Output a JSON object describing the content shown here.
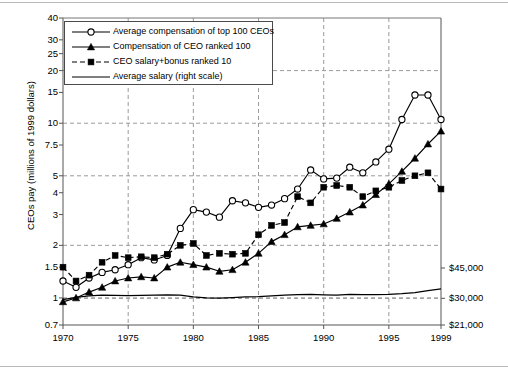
{
  "chart_data": {
    "type": "line",
    "title": "",
    "xlabel": "",
    "ylabel": "CEOs pay (millions of 1999 dollars)",
    "y_scale": "log",
    "ylim": [
      0.7,
      40
    ],
    "xlim": [
      1970,
      1999
    ],
    "grid": true,
    "legend_position": "top-left",
    "y_ticks": [
      "40",
      "30",
      "25",
      "20",
      "15",
      "10",
      "7.5",
      "5",
      "4",
      "3",
      "2",
      "1.5",
      "1",
      "0.7"
    ],
    "y_tick_values": [
      40,
      30,
      25,
      20,
      15,
      10,
      7.5,
      5,
      4,
      3,
      2,
      1.5,
      1,
      0.7
    ],
    "gridline_values": [
      40,
      20,
      10,
      5,
      2,
      1
    ],
    "x_ticks": [
      "1970",
      "1975",
      "1980",
      "1985",
      "1990",
      "1995",
      "1999"
    ],
    "x_tick_values": [
      1970,
      1975,
      1980,
      1985,
      1990,
      1995,
      1999
    ],
    "x_minor_ticks": [
      1970,
      1975,
      1980,
      1985,
      1990,
      1995,
      1999
    ],
    "right_axis": {
      "label": "",
      "ticks": [
        "$45,000",
        "$30,000",
        "$21,000"
      ],
      "tick_values": [
        45000,
        30000,
        21000
      ]
    },
    "x": [
      1970,
      1971,
      1972,
      1973,
      1974,
      1975,
      1976,
      1977,
      1978,
      1979,
      1980,
      1981,
      1982,
      1983,
      1984,
      1985,
      1986,
      1987,
      1988,
      1989,
      1990,
      1991,
      1992,
      1993,
      1994,
      1995,
      1996,
      1997,
      1998,
      1999
    ],
    "series": [
      {
        "name": "Average compensation of top 100 CEOs",
        "marker": "open-circle",
        "linestyle": "solid",
        "axis": "left",
        "values": [
          1.25,
          1.15,
          1.3,
          1.4,
          1.45,
          1.55,
          1.7,
          1.65,
          1.75,
          2.5,
          3.2,
          3.1,
          2.9,
          3.6,
          3.5,
          3.3,
          3.4,
          3.7,
          4.2,
          5.4,
          4.8,
          4.85,
          5.6,
          5.2,
          6.0,
          7.1,
          10.5,
          14.5,
          14.5,
          10.5
        ]
      },
      {
        "name": "Compensation of CEO ranked 100",
        "marker": "filled-triangle",
        "linestyle": "solid",
        "axis": "left",
        "values": [
          0.95,
          1.0,
          1.08,
          1.15,
          1.25,
          1.3,
          1.32,
          1.3,
          1.5,
          1.6,
          1.55,
          1.5,
          1.42,
          1.45,
          1.6,
          1.8,
          2.1,
          2.3,
          2.55,
          2.6,
          2.65,
          2.85,
          3.1,
          3.4,
          3.9,
          4.5,
          5.3,
          6.3,
          7.6,
          9.0
        ]
      },
      {
        "name": "CEO salary+bonus ranked 10",
        "marker": "filled-square",
        "linestyle": "dashed",
        "axis": "left",
        "values": [
          1.5,
          1.25,
          1.35,
          1.6,
          1.75,
          1.7,
          1.72,
          1.7,
          1.78,
          2.0,
          2.05,
          1.75,
          1.8,
          1.78,
          1.8,
          2.3,
          2.6,
          2.7,
          3.8,
          3.5,
          4.3,
          4.4,
          4.3,
          3.8,
          4.1,
          4.3,
          4.7,
          5.0,
          5.2,
          4.2
        ]
      },
      {
        "name": "Average salary (right scale)",
        "marker": "none",
        "linestyle": "solid",
        "axis": "right",
        "right_values": [
          29500,
          30400,
          31000,
          31300,
          31200,
          31100,
          31200,
          31300,
          31400,
          31300,
          30600,
          30200,
          30100,
          30300,
          30600,
          30700,
          31000,
          31300,
          31500,
          31600,
          31400,
          31300,
          31600,
          31500,
          31500,
          31600,
          31900,
          32400,
          33200,
          34000
        ]
      }
    ],
    "legend": [
      {
        "label": "Average compensation of top 100 CEOs",
        "marker": "open-circle",
        "linestyle": "solid"
      },
      {
        "label": "Compensation of CEO ranked 100",
        "marker": "filled-triangle",
        "linestyle": "solid"
      },
      {
        "label": "CEO salary+bonus ranked 10",
        "marker": "filled-square",
        "linestyle": "dashed"
      },
      {
        "label": "Average salary (right scale)",
        "marker": "none",
        "linestyle": "solid"
      }
    ],
    "colors": {
      "line": "#000000",
      "grid": "#9a9a9a",
      "axis": "#555555",
      "background": "#ffffff"
    }
  }
}
